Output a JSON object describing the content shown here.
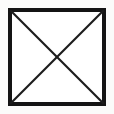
{
  "figure": {
    "background_color": "#fbfbfa",
    "interior_fill": "#ffffff",
    "stroke_color": "#141414",
    "diagonal_color": "#1c1c1c",
    "canvas": {
      "width": 114,
      "height": 114
    },
    "square": {
      "name": "square-outline",
      "left": 8,
      "top": 8,
      "right": 106,
      "bottom": 106,
      "width": 98,
      "height": 98,
      "border_width": 4
    },
    "diagonals": [
      {
        "name": "diagonal-top-left-to-bottom-right",
        "x1": 10,
        "y1": 10,
        "x2": 104,
        "y2": 104,
        "stroke_width": 2.1
      },
      {
        "name": "diagonal-top-right-to-bottom-left",
        "x1": 104,
        "y1": 10,
        "x2": 10,
        "y2": 104,
        "stroke_width": 2.1
      }
    ],
    "intersection": {
      "name": "diagonal-intersection-center",
      "x": 57,
      "y": 57
    },
    "corners": [
      {
        "name": "corner-top-left",
        "x": 8,
        "y": 8
      },
      {
        "name": "corner-top-right",
        "x": 106,
        "y": 8
      },
      {
        "name": "corner-bottom-right",
        "x": 106,
        "y": 106
      },
      {
        "name": "corner-bottom-left",
        "x": 8,
        "y": 106
      }
    ],
    "caption": ""
  }
}
